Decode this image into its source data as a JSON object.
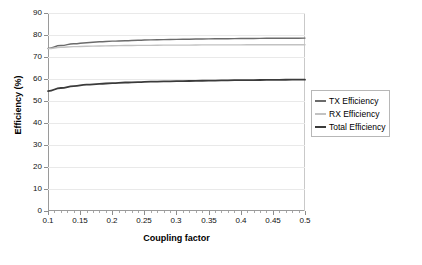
{
  "chart_data": {
    "type": "line",
    "title": "",
    "xlabel": "Coupling factor",
    "ylabel": "Efficiency (%)",
    "xlim": [
      0.1,
      0.5
    ],
    "ylim": [
      0,
      90
    ],
    "grid": true,
    "legend_position": "right",
    "x_ticks": [
      "0.1",
      "0.15",
      "0.2",
      "0.25",
      "0.3",
      "0.35",
      "0.4",
      "0.45",
      "0.5"
    ],
    "x_tick_values": [
      0.1,
      0.15,
      0.2,
      0.25,
      0.3,
      0.35,
      0.4,
      0.45,
      0.5
    ],
    "y_ticks": [
      "0",
      "10",
      "20",
      "30",
      "40",
      "50",
      "60",
      "70",
      "80",
      "90"
    ],
    "y_tick_values": [
      0,
      10,
      20,
      30,
      40,
      50,
      60,
      70,
      80,
      90
    ],
    "x": [
      0.1,
      0.12,
      0.14,
      0.16,
      0.18,
      0.2,
      0.22,
      0.24,
      0.26,
      0.28,
      0.3,
      0.32,
      0.34,
      0.36,
      0.38,
      0.4,
      0.42,
      0.44,
      0.46,
      0.48,
      0.5
    ],
    "series": [
      {
        "name": "TX Efficiency",
        "color": "#6b6b6b",
        "width": 1.4,
        "values": [
          73.9,
          75.2,
          76.0,
          76.5,
          76.9,
          77.2,
          77.4,
          77.6,
          77.8,
          77.9,
          78.0,
          78.1,
          78.2,
          78.3,
          78.3,
          78.4,
          78.4,
          78.5,
          78.5,
          78.5,
          78.6
        ]
      },
      {
        "name": "RX Efficiency",
        "color": "#c2c2c2",
        "width": 1.4,
        "values": [
          73.8,
          74.4,
          74.7,
          74.9,
          75.0,
          75.1,
          75.2,
          75.3,
          75.3,
          75.4,
          75.4,
          75.4,
          75.5,
          75.5,
          75.5,
          75.5,
          75.6,
          75.6,
          75.6,
          75.6,
          75.6
        ]
      },
      {
        "name": "Total Efficiency",
        "color": "#3b3b3b",
        "width": 1.8,
        "values": [
          54.5,
          55.9,
          56.8,
          57.4,
          57.8,
          58.1,
          58.4,
          58.6,
          58.8,
          58.9,
          59.0,
          59.1,
          59.2,
          59.3,
          59.4,
          59.5,
          59.5,
          59.6,
          59.6,
          59.7,
          59.7
        ]
      }
    ]
  },
  "legend": {
    "items": [
      {
        "label": "TX Efficiency",
        "color": "#6b6b6b"
      },
      {
        "label": "RX Efficiency",
        "color": "#c2c2c2"
      },
      {
        "label": "Total Efficiency",
        "color": "#3b3b3b"
      }
    ]
  },
  "axes": {
    "x_title": "Coupling factor",
    "y_title": "Efficiency (%)"
  }
}
